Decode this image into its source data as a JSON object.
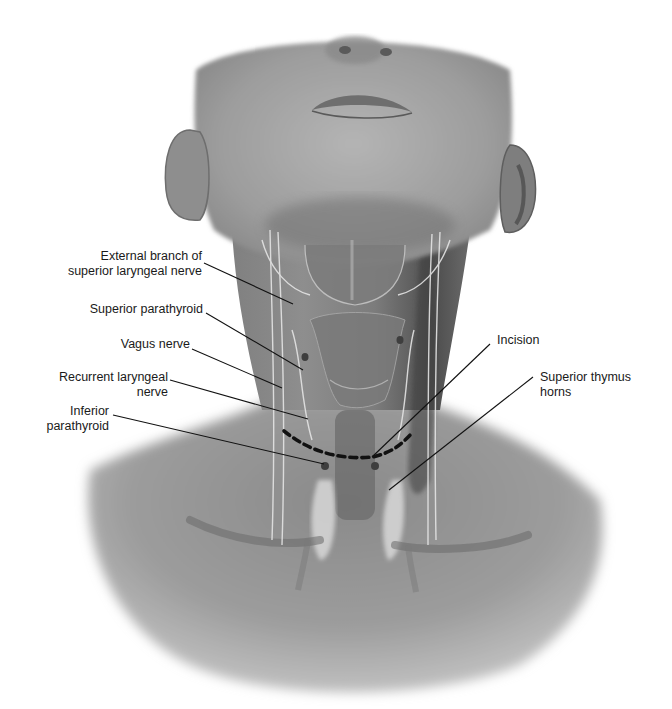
{
  "figure": {
    "colors": {
      "background": "#ffffff",
      "skin_light": "#a8a8a8",
      "skin_mid": "#8e8e8e",
      "skin_dark": "#5c5c5c",
      "nerve": "#e2e2e2",
      "leader_line": "#111111",
      "incision": "#111111",
      "label_text": "#1a1a1a"
    },
    "labels": [
      {
        "id": "external-branch-sln",
        "lines": [
          "External branch of",
          "superior laryngeal nerve"
        ],
        "side": "left"
      },
      {
        "id": "superior-parathyroid",
        "lines": [
          "Superior parathyroid"
        ],
        "side": "left"
      },
      {
        "id": "vagus-nerve",
        "lines": [
          "Vagus nerve"
        ],
        "side": "left"
      },
      {
        "id": "recurrent-laryngeal-nerve",
        "lines": [
          "Recurrent laryngeal",
          "nerve"
        ],
        "side": "left"
      },
      {
        "id": "inferior-parathyroid",
        "lines": [
          "Inferior",
          "parathyroid"
        ],
        "side": "left"
      },
      {
        "id": "incision",
        "lines": [
          "Incision"
        ],
        "side": "right"
      },
      {
        "id": "superior-thymus-horns",
        "lines": [
          "Superior thymus",
          "horns"
        ],
        "side": "right"
      }
    ]
  }
}
